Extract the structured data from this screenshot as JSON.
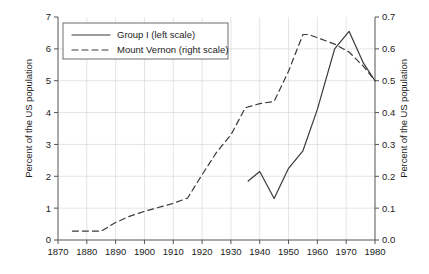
{
  "chart_data": {
    "type": "line",
    "title": "",
    "subtitle": "",
    "xlabel": "",
    "ylabel": "Percent of the US population",
    "ylabel_right": "Percent of the US population",
    "xlim": [
      1870,
      1980
    ],
    "ylim": [
      0,
      7
    ],
    "ylim_right": [
      0.0,
      0.7
    ],
    "xticks": [
      1870,
      1880,
      1890,
      1900,
      1910,
      1920,
      1930,
      1940,
      1950,
      1960,
      1970,
      1980
    ],
    "xtick_labels": [
      "1870",
      "1880",
      "1890",
      "1900",
      "1910",
      "1920",
      "1930",
      "1940",
      "1950",
      "1960",
      "1970",
      "1980"
    ],
    "yticks": [
      0,
      1,
      2,
      3,
      4,
      5,
      6,
      7
    ],
    "ytick_labels": [
      "0",
      "1",
      "2",
      "3",
      "4",
      "5",
      "6",
      "7"
    ],
    "yticks_right": [
      0.0,
      0.1,
      0.2,
      0.3,
      0.4,
      0.5,
      0.6,
      0.7
    ],
    "ytick_labels_right": [
      "0.0",
      "0.1",
      "0.2",
      "0.3",
      "0.4",
      "0.5",
      "0.6",
      "0.7"
    ],
    "grid": true,
    "legend_position": "upper-left",
    "series": [
      {
        "name": "Group I (left scale)",
        "axis": "left",
        "style": "solid",
        "color": "#3a3a3a",
        "points": [
          [
            1936,
            1.85
          ],
          [
            1940,
            2.15
          ],
          [
            1945,
            1.3
          ],
          [
            1950,
            2.25
          ],
          [
            1955,
            2.8
          ],
          [
            1960,
            4.1
          ],
          [
            1966,
            6.0
          ],
          [
            1971,
            6.55
          ],
          [
            1976,
            5.55
          ],
          [
            1980,
            5.0
          ]
        ]
      },
      {
        "name": "Mount Vernon (right scale)",
        "axis": "right",
        "style": "dashed",
        "color": "#3a3a3a",
        "points": [
          [
            1875,
            0.028
          ],
          [
            1880,
            0.028
          ],
          [
            1885,
            0.028
          ],
          [
            1890,
            0.055
          ],
          [
            1895,
            0.075
          ],
          [
            1900,
            0.09
          ],
          [
            1910,
            0.115
          ],
          [
            1915,
            0.132
          ],
          [
            1920,
            0.205
          ],
          [
            1925,
            0.275
          ],
          [
            1930,
            0.33
          ],
          [
            1935,
            0.415
          ],
          [
            1940,
            0.428
          ],
          [
            1945,
            0.435
          ],
          [
            1950,
            0.53
          ],
          [
            1955,
            0.645
          ],
          [
            1957,
            0.645
          ],
          [
            1960,
            0.635
          ],
          [
            1966,
            0.615
          ],
          [
            1971,
            0.59
          ],
          [
            1976,
            0.545
          ],
          [
            1980,
            0.5
          ]
        ]
      }
    ],
    "legend_entries": [
      {
        "label": "Group I (left scale)",
        "style": "solid"
      },
      {
        "label": "Mount Vernon (right scale)",
        "style": "dashed"
      }
    ]
  }
}
